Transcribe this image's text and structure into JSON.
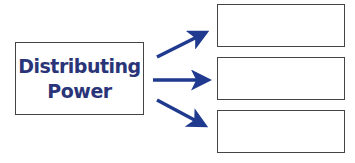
{
  "diagram": {
    "source": {
      "line1": "Distributing",
      "line2": "Power"
    },
    "targets": [
      {
        "label": ""
      },
      {
        "label": ""
      },
      {
        "label": ""
      }
    ],
    "arrow_color": "#1f3a8f",
    "text_color": "#2a3478"
  }
}
